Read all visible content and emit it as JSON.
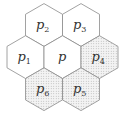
{
  "diagram": {
    "type": "hexagonal-cell-neighborhood",
    "cells": [
      {
        "id": "p2",
        "base": "p",
        "sub": "2",
        "shaded": false
      },
      {
        "id": "p3",
        "base": "p",
        "sub": "3",
        "shaded": false
      },
      {
        "id": "p1",
        "base": "p",
        "sub": "1",
        "shaded": false
      },
      {
        "id": "p",
        "base": "p",
        "sub": "",
        "shaded": false
      },
      {
        "id": "p4",
        "base": "p",
        "sub": "4",
        "shaded": true
      },
      {
        "id": "p6",
        "base": "p",
        "sub": "6",
        "shaded": true
      },
      {
        "id": "p5",
        "base": "p",
        "sub": "5",
        "shaded": true
      }
    ],
    "colors": {
      "stroke": "#8a8a8a",
      "fill": "#ffffff",
      "stipple_dot": "#9a9a9a",
      "text": "#333333"
    }
  }
}
